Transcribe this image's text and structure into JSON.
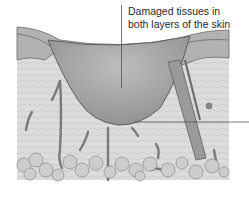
{
  "diagram": {
    "callouts": [
      {
        "id": "damaged-tissues",
        "lines": [
          "Damaged tissues in",
          "both layers of the skin"
        ]
      },
      {
        "id": "right-pointer",
        "lines": []
      }
    ],
    "colors": {
      "background": "#ffffff",
      "epidermis": "#b9b9b9",
      "dermis": "#d6d6d6",
      "wound": "#a9a9a9",
      "fat": "#c8c8c8",
      "outline": "#6a6a6a",
      "pointer": "#555555",
      "text": "#2a2a2a"
    }
  }
}
